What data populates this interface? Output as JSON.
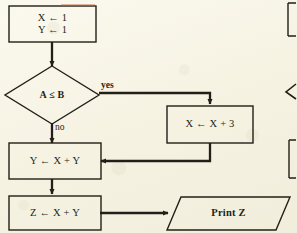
{
  "diagram": {
    "type": "flowchart",
    "background_color": "#f6f3e3",
    "stroke_color": "#231f18",
    "nodes": [
      {
        "id": "init",
        "shape": "rectangle",
        "name": "init-box",
        "lines": [
          "X ← 1",
          "Y ← 1"
        ]
      },
      {
        "id": "decision",
        "shape": "diamond",
        "name": "decision-diamond",
        "lines": [
          "A ≤ B"
        ]
      },
      {
        "id": "increment",
        "shape": "rectangle",
        "name": "increment-box",
        "lines": [
          "X ← X + 3"
        ]
      },
      {
        "id": "sum_y",
        "shape": "rectangle",
        "name": "sum-y-box",
        "lines": [
          "Y ← X + Y"
        ]
      },
      {
        "id": "sum_z",
        "shape": "rectangle",
        "name": "sum-z-box",
        "lines": [
          "Z ← X + Y"
        ]
      },
      {
        "id": "print",
        "shape": "parallelogram",
        "name": "print-parallelogram",
        "lines": [
          "Print Z"
        ]
      }
    ],
    "edge_labels": {
      "yes": "yes",
      "no": "no"
    }
  }
}
